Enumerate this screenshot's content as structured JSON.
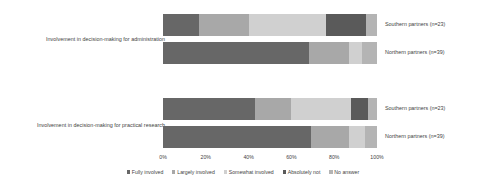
{
  "chart_data": {
    "type": "bar",
    "orientation": "horizontal",
    "stacked": true,
    "stack_mode": "percent",
    "title": "",
    "xlabel": "",
    "ylabel": "",
    "xlim": [
      0,
      100
    ],
    "grid": false,
    "legend_position": "bottom",
    "x_tick_labels": [
      "0%",
      "20%",
      "40%",
      "60%",
      "80%",
      "100%"
    ],
    "x_tick_values": [
      0,
      20,
      40,
      60,
      80,
      100
    ],
    "groups": [
      {
        "label": "Involvement in decision-making for administration",
        "rows": [
          "Southern partners  (n=23)",
          "Northern partners  (n=39)"
        ]
      },
      {
        "label": "Involvement in decision-making for practical research",
        "rows": [
          "Southern partners  (n=23)",
          "Northern partners  (n=39)"
        ]
      }
    ],
    "categories": [
      "Southern partners  (n=23)",
      "Northern partners  (n=39)",
      "Southern partners  (n=23)",
      "Northern partners  (n=39)"
    ],
    "series": [
      {
        "name": "Fully involved",
        "color": "#676767",
        "values": [
          17,
          68,
          43,
          69
        ]
      },
      {
        "name": "Largely involved",
        "color": "#a8a8a8",
        "values": [
          23,
          19,
          17,
          18
        ]
      },
      {
        "name": "Somewhat involved",
        "color": "#d0d0d0",
        "values": [
          36,
          6,
          28,
          7.5
        ]
      },
      {
        "name": "Absolutely not",
        "color": "#5a5a5a",
        "values": [
          19,
          0,
          8,
          0
        ]
      },
      {
        "name": "No answer",
        "color": "#b4b4b4",
        "values": [
          5,
          7,
          4,
          5.5
        ]
      }
    ],
    "legend": [
      {
        "label": "Fully involved",
        "color": "#676767"
      },
      {
        "label": "Largely involved",
        "color": "#a8a8a8"
      },
      {
        "label": "Somewhat involved",
        "color": "#d0d0d0"
      },
      {
        "label": "Absolutely not",
        "color": "#5a5a5a"
      },
      {
        "label": "No answer",
        "color": "#b4b4b4"
      }
    ]
  }
}
